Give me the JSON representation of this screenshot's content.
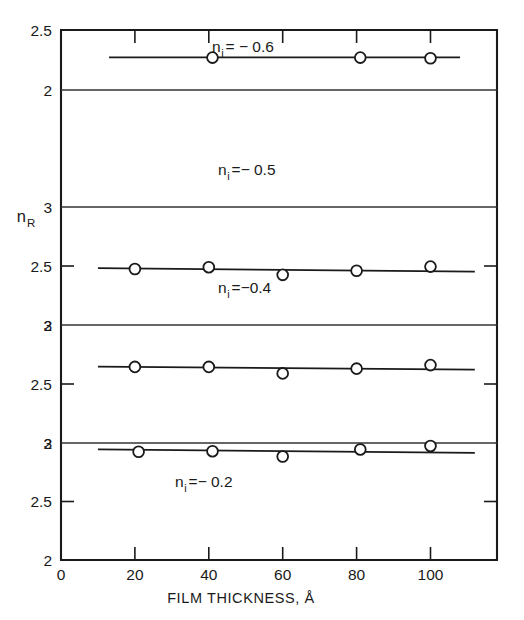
{
  "figure": {
    "title": "",
    "ylabel": "n",
    "ylabel_sub": "R",
    "xlabel": "FILM THICKNESS, Å"
  },
  "chart_data": {
    "type": "scatter",
    "title": "",
    "xlabel": "FILM THICKNESS, Å",
    "ylabel": "n_R",
    "xlim": [
      0,
      118
    ],
    "xticks": [
      0,
      20,
      40,
      60,
      80,
      100
    ],
    "xtick_labels": [
      "0",
      "20",
      "40",
      "60",
      "80",
      "100"
    ],
    "grid": false,
    "legend": "none",
    "note": "Four stacked subpanels sharing one x-axis; each panel y-axis is inverted (values increase downward).",
    "panels": [
      {
        "label": "n",
        "label_sub": "i",
        "label_value": "= − 0.6",
        "label_full": "n_i = -0.6",
        "ylim": [
          2.5,
          2.0
        ],
        "yticks": [
          2.5,
          2.0
        ],
        "ytick_labels": [
          "2.5",
          "2"
        ],
        "series": [
          {
            "name": "n_i = -0.6",
            "x": [
              41,
              81,
              100
            ],
            "y": [
              2.27,
              2.27,
              2.265
            ],
            "marker": "open-circle"
          }
        ],
        "fit_line": {
          "x": [
            13,
            108
          ],
          "y": [
            2.272,
            2.272
          ]
        }
      },
      {
        "label": "n",
        "label_sub": "i",
        "label_value": "=− 0.5",
        "label_full": "n_i = -0.5",
        "ylim": [
          3.0,
          2.0
        ],
        "yticks": [
          3.0,
          2.5,
          2.0
        ],
        "ytick_labels": [
          "3",
          "2.5",
          "2"
        ],
        "series": [
          {
            "name": "n_i = -0.5",
            "x": [
              20,
              40,
              60,
              80,
              100
            ],
            "y": [
              2.475,
              2.49,
              2.425,
              2.46,
              2.495
            ],
            "marker": "open-circle"
          }
        ],
        "fit_line": {
          "x": [
            10,
            112
          ],
          "y": [
            2.482,
            2.452
          ]
        }
      },
      {
        "label": "n",
        "label_sub": "i",
        "label_value": "=−0.4",
        "label_full": "n_i = -0.4",
        "ylim": [
          3.0,
          2.0
        ],
        "yticks": [
          3.0,
          2.5,
          2.0
        ],
        "ytick_labels": [
          "3",
          "2.5",
          "2"
        ],
        "series": [
          {
            "name": "n_i = -0.4",
            "x": [
              20,
              40,
              60,
              80,
              100
            ],
            "y": [
              2.645,
              2.645,
              2.59,
              2.63,
              2.66
            ],
            "marker": "open-circle"
          }
        ],
        "fit_line": {
          "x": [
            10,
            112
          ],
          "y": [
            2.648,
            2.622
          ]
        }
      },
      {
        "label": "n",
        "label_sub": "i",
        "label_value": "=− 0.2",
        "label_full": "n_i = -0.2",
        "ylim": [
          3.0,
          2.0
        ],
        "yticks": [
          3.0,
          2.5,
          2.0
        ],
        "ytick_labels": [
          "3",
          "2.5",
          "2"
        ],
        "series": [
          {
            "name": "n_i = -0.2",
            "x": [
              21,
              41,
              60,
              81,
              100
            ],
            "y": [
              2.925,
              2.93,
              2.885,
              2.945,
              2.975
            ],
            "marker": "open-circle"
          }
        ],
        "fit_line": {
          "x": [
            10,
            112
          ],
          "y": [
            2.945,
            2.915
          ]
        }
      }
    ]
  },
  "colors": {
    "ink": "#1a1a1a",
    "background": "#ffffff",
    "divider": "#333333"
  }
}
